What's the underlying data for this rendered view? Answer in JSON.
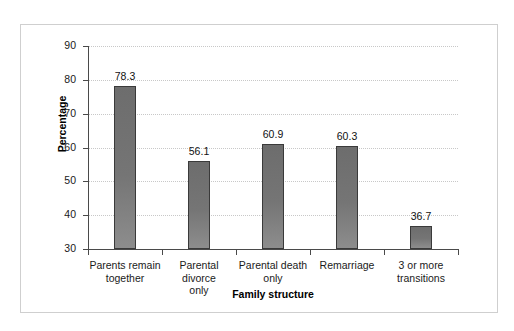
{
  "chart_data": {
    "type": "bar",
    "title": "",
    "xlabel": "Family structure",
    "ylabel": "Percentage",
    "categories": [
      "Parents remain together",
      "Parental divorce only",
      "Parental death only",
      "Remarriage",
      "3 or more transitions"
    ],
    "category_lines": [
      [
        "Parents remain",
        "together"
      ],
      [
        "Parental divorce",
        "only"
      ],
      [
        "Parental death",
        "only"
      ],
      [
        "Remarriage",
        ""
      ],
      [
        "3 or more",
        "transitions"
      ]
    ],
    "values": [
      78.3,
      56.1,
      60.9,
      60.3,
      36.7
    ],
    "value_labels": [
      "78.3",
      "56.1",
      "60.9",
      "60.3",
      "36.7"
    ],
    "ylim": [
      30,
      90
    ],
    "yticks": [
      30,
      40,
      50,
      60,
      70,
      80,
      90
    ],
    "ytick_labels": [
      "30",
      "40",
      "50",
      "60",
      "70",
      "80",
      "90"
    ],
    "grid": true,
    "grid_axis": "y",
    "grid_style": "dotted",
    "legend": false,
    "legend_position": "none",
    "bar_color": "#757575",
    "bar_edge_color": "#3a3a3a",
    "grid_color": "#c8c8c8",
    "axis_color": "#4a4a4a",
    "frame_color": "#cfcfcf",
    "background_color": "#ffffff",
    "text_color": "#1a1a1a"
  }
}
